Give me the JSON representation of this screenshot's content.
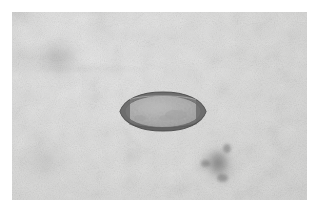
{
  "view": {
    "kind": "micrograph-viewer",
    "width_px": 319,
    "height_px": 213,
    "modality": "brightfield light microscopy",
    "color_mode": "grayscale",
    "margin_color": "#ffffff",
    "alt_text": "Grayscale light-microscopy image of a single ovoid parasite egg on a mottled pale gray background"
  },
  "field": {
    "label": "specimen field",
    "x_px": 12,
    "y_px": 12,
    "width_px": 295,
    "height_px": 188,
    "background_color": "#dededd",
    "background_light": "#e8e8e8",
    "background_dark": "#cfcfce",
    "texture": "fine granular film grain with soft uneven illumination blotches"
  },
  "specimen": {
    "name": "parasite-egg",
    "label": "ovum",
    "shape": "ellipsoid / lemon-shaped with tapered polar ends",
    "orientation": "horizontal long axis",
    "center_x_px": 163,
    "center_y_px": 111,
    "width_px": 90,
    "height_px": 41,
    "shell": {
      "label": "egg shell (wall)",
      "color": "#6f6f6f",
      "outline_color": "#5a5a5a",
      "thickness_px": 3
    },
    "interior": {
      "label": "interior contents",
      "color": "#a8a8a8",
      "highlight_color": "#bdbdbd",
      "texture": "faint granular internal contents"
    },
    "polar_plugs": {
      "label": "tapered polar ends",
      "count": 2,
      "color": "#666666"
    }
  },
  "artifacts": [
    {
      "name": "dark-debris-lower-right",
      "label": "dark debris cluster",
      "x_px": 197,
      "y_px": 140,
      "width_px": 44,
      "height_px": 48,
      "color": "#5c5c5c",
      "opacity": 0.6
    },
    {
      "name": "faint-patch-upper-left",
      "label": "faint background patch",
      "x_px": 36,
      "y_px": 34,
      "width_px": 46,
      "height_px": 46,
      "color": "#828282",
      "opacity": 0.3
    },
    {
      "name": "faint-patch-lower-left",
      "label": "faint background patch",
      "x_px": 20,
      "y_px": 140,
      "width_px": 52,
      "height_px": 40,
      "color": "#8c8c8c",
      "opacity": 0.2
    }
  ],
  "overlays": {
    "scale_bar": null,
    "caption": null,
    "annotations": []
  }
}
